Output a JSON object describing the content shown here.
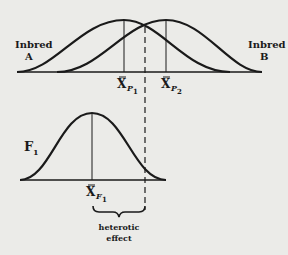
{
  "diagram": {
    "parents": {
      "a": {
        "label_line1": "Inbred",
        "label_line2": "A",
        "mean_label": "X",
        "mean_sub": "P",
        "mean_subsub": "1"
      },
      "b": {
        "label_line1": "Inbred",
        "label_line2": "B",
        "mean_label": "X",
        "mean_sub": "P",
        "mean_subsub": "2"
      }
    },
    "hybrid": {
      "label": "F",
      "label_sub": "1",
      "mean_label": "X",
      "mean_sub": "F",
      "mean_subsub": "1"
    },
    "annotation": {
      "line1": "heterotic",
      "line2": "effect"
    },
    "colors": {
      "ink": "#1a1a1a",
      "paper": "#ebebe8"
    }
  }
}
